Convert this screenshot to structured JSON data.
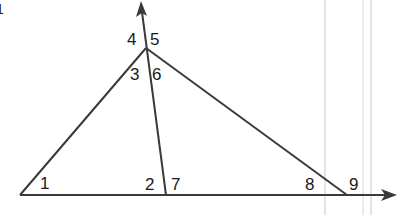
{
  "diagram": {
    "type": "triangle-with-extended-sides",
    "colors": {
      "line": "#3a3a3a",
      "label": "#1a1a1a",
      "guide": "#c8c8c8",
      "background": "#ffffff"
    },
    "vertices": {
      "left": [
        20,
        195
      ],
      "top": [
        146,
        48
      ],
      "cevian_foot": [
        166,
        195
      ],
      "right": [
        347,
        195
      ]
    },
    "rays": {
      "base_end": [
        394,
        195
      ],
      "cevian_extension_end": [
        141,
        3
      ]
    },
    "angle_labels": [
      {
        "id": "1",
        "text": "1",
        "x": 40,
        "y": 189
      },
      {
        "id": "2",
        "text": "2",
        "x": 145,
        "y": 190
      },
      {
        "id": "3",
        "text": "3",
        "x": 130,
        "y": 78
      },
      {
        "id": "4",
        "text": "4",
        "x": 128,
        "y": 44
      },
      {
        "id": "5",
        "text": "5",
        "x": 149,
        "y": 44
      },
      {
        "id": "6",
        "text": "6",
        "x": 152,
        "y": 78
      },
      {
        "id": "7",
        "text": "7",
        "x": 171,
        "y": 190
      },
      {
        "id": "8",
        "text": "8",
        "x": 305,
        "y": 190
      },
      {
        "id": "9",
        "text": "9",
        "x": 349,
        "y": 190
      }
    ],
    "corner_mark": "1"
  }
}
